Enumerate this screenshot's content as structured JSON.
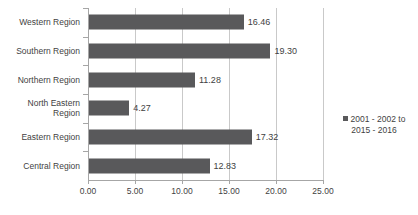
{
  "chart_data": {
    "type": "bar",
    "orientation": "horizontal",
    "title": "",
    "xlabel": "",
    "ylabel": "",
    "xlim": [
      0,
      25
    ],
    "xticks": [
      "0.00",
      "5.00",
      "10.00",
      "15.00",
      "20.00",
      "25.00"
    ],
    "xtick_values": [
      0,
      5,
      10,
      15,
      20,
      25
    ],
    "grid": true,
    "legend_position": "right",
    "series": [
      {
        "name": "2001 - 2002 to\n2015 - 2016",
        "color": "#59595b",
        "values": [
          16.46,
          19.3,
          11.28,
          4.27,
          17.32,
          12.83
        ]
      }
    ],
    "categories": [
      "Western Region",
      "Southern Region",
      "Northern Region",
      "North Eastern\nRegion",
      "Eastern Region",
      "Central Region"
    ],
    "data_labels": [
      "16.46",
      "19.30",
      "11.28",
      "4.27",
      "17.32",
      "12.83"
    ]
  },
  "legend": {
    "entries": [
      {
        "label": "2001 - 2002 to\n2015 - 2016",
        "color": "#59595b"
      }
    ]
  },
  "colors": {
    "bar": "#59595b",
    "gridline": "#c9c9c9",
    "axis": "#a6a6a6",
    "text": "#3f3f3f",
    "background": "#ffffff"
  }
}
